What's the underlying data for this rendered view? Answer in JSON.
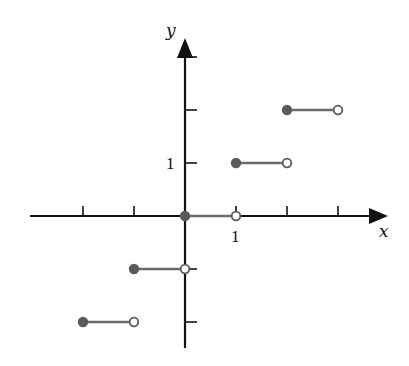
{
  "chart_data": {
    "type": "line",
    "title": "",
    "function": "greatest integer function y = floor(x)",
    "xlabel": "x",
    "ylabel": "y",
    "xlim": [
      -3,
      3
    ],
    "ylim": [
      -2,
      3
    ],
    "x_ticks": [
      -2,
      -1,
      0,
      1,
      2,
      3
    ],
    "y_ticks": [
      -2,
      -1,
      0,
      1,
      2,
      3
    ],
    "x_tick_labels": [
      {
        "value": 1,
        "label": "1"
      }
    ],
    "y_tick_labels": [
      {
        "value": 1,
        "label": "1"
      }
    ],
    "grid": false,
    "legend": null,
    "segments": [
      {
        "x_start": -2,
        "x_end": -1,
        "y": -2,
        "start_closed": true,
        "end_closed": false
      },
      {
        "x_start": -1,
        "x_end": 0,
        "y": -1,
        "start_closed": true,
        "end_closed": false
      },
      {
        "x_start": 0,
        "x_end": 1,
        "y": 0,
        "start_closed": true,
        "end_closed": false
      },
      {
        "x_start": 1,
        "x_end": 2,
        "y": 1,
        "start_closed": true,
        "end_closed": false
      },
      {
        "x_start": 2,
        "x_end": 3,
        "y": 2,
        "start_closed": true,
        "end_closed": false
      }
    ]
  },
  "style": {
    "axis_color": "#111111",
    "segment_color": "#6b6b6b",
    "dot_fill": "#5a5a5a",
    "open_dot_fill": "#ffffff"
  },
  "labels": {
    "x_axis": "x",
    "y_axis": "y",
    "x_one": "1",
    "y_one": "1"
  }
}
